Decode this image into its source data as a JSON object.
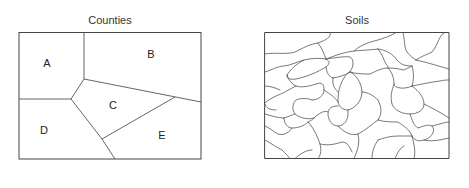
{
  "figure": {
    "panels": [
      {
        "title": "Counties",
        "regions": [
          {
            "label": "A",
            "x": 47,
            "y": 63
          },
          {
            "label": "B",
            "x": 151,
            "y": 54
          },
          {
            "label": "C",
            "x": 113,
            "y": 105
          },
          {
            "label": "D",
            "x": 44,
            "y": 130
          },
          {
            "label": "E",
            "x": 162,
            "y": 135
          }
        ]
      },
      {
        "title": "Soils",
        "description": "many irregular soil polygons"
      }
    ],
    "colors": {
      "line": "#555555",
      "frame": "#444444",
      "text": "#333333",
      "background": "#ffffff"
    }
  }
}
